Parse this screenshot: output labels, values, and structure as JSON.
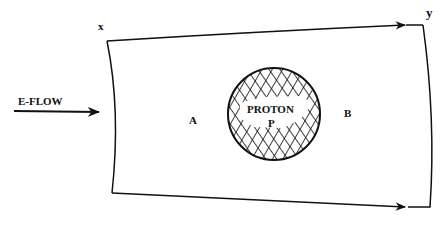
{
  "diagram": {
    "labels": {
      "corner_top_left": "x",
      "corner_top_right": "y",
      "incoming_arrow": "E-FLOW",
      "left_region": "A",
      "right_region": "B",
      "proton_title": "PROTON",
      "proton_symbol": "P"
    },
    "colors": {
      "background": "#ffffff",
      "ink": "#111111"
    }
  }
}
